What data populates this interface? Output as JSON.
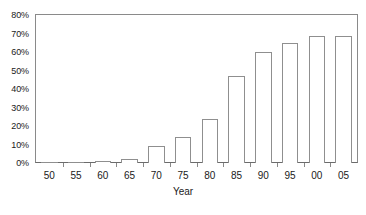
{
  "chart_data": {
    "type": "bar",
    "title": "",
    "subtitle": "",
    "xlabel": "Year",
    "ylabel": "",
    "categories": [
      "50",
      "55",
      "60",
      "65",
      "70",
      "75",
      "80",
      "85",
      "90",
      "95",
      "00",
      "05"
    ],
    "values": [
      0,
      0.3,
      1,
      2,
      9,
      14,
      24,
      47,
      60,
      65,
      68.5,
      68.5
    ],
    "value_format": "percent",
    "ylim": [
      0,
      80
    ],
    "ytick_values": [
      0,
      10,
      20,
      30,
      40,
      50,
      60,
      70,
      80
    ],
    "ytick_labels": [
      "0%",
      "10%",
      "20%",
      "30%",
      "40%",
      "50%",
      "60%",
      "70%",
      "80%"
    ],
    "xtick_labels": [
      "50",
      "55",
      "60",
      "65",
      "70",
      "75",
      "80",
      "85",
      "90",
      "95",
      "00",
      "05"
    ],
    "grid": false,
    "legend": null,
    "legend_position": "none",
    "annotations": [],
    "bar_fill_color": "#ffffff",
    "bar_edge_color": "#8f8f8f",
    "axis_color": "#8a8a8a",
    "text_color": "#1a1a1a",
    "background_color": "#ffffff"
  },
  "axes": {
    "y_axis_name": "percentage-axis",
    "x_axis_name": "year-axis"
  },
  "caption": {
    "fragment": ""
  }
}
